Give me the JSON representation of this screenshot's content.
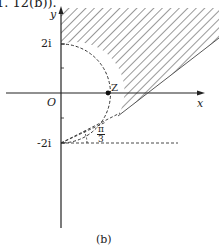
{
  "header_fragment": "1. 12(b)).",
  "axes": {
    "x_label": "x",
    "y_label": "y",
    "origin_label": "O"
  },
  "ticks": {
    "upper": "2i",
    "lower": "-2i"
  },
  "point_label": "Z",
  "angle": {
    "numerator": "π",
    "denominator": "3"
  },
  "caption": "(b)",
  "colors": {
    "ink": "#222222",
    "background": "#ffffff"
  }
}
